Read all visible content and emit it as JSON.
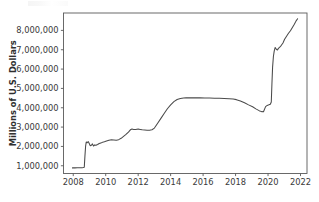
{
  "chart_data": {
    "type": "line",
    "title": "",
    "subtitle": "",
    "xlabel": "",
    "ylabel": "Millions of U.S. Dollars",
    "xlim": [
      2007.4,
      2022.4
    ],
    "ylim": [
      600000,
      8900000
    ],
    "xticks": [
      2008,
      2010,
      2012,
      2014,
      2016,
      2018,
      2020,
      2022
    ],
    "xticklabels": [
      "2008",
      "2010",
      "2012",
      "2014",
      "2016",
      "2018",
      "2020",
      "2022"
    ],
    "yticks": [
      1000000,
      2000000,
      3000000,
      4000000,
      5000000,
      6000000,
      7000000,
      8000000
    ],
    "yticklabels": [
      "1,000,000",
      "2,000,000",
      "3,000,000",
      "4,000,000",
      "5,000,000",
      "6,000,000",
      "7,000,000",
      "8,000,000"
    ],
    "grid": false,
    "legend": false,
    "legend_position": "none",
    "line_color": "#4a4a4a",
    "background_color": "#ffffff",
    "axis_color": "#5a5a5a",
    "series": [
      {
        "name": "Total Assets",
        "color": "#4a4a4a",
        "x": [
          2007.95,
          2008.1,
          2008.25,
          2008.4,
          2008.55,
          2008.62,
          2008.68,
          2008.72,
          2008.76,
          2008.8,
          2008.86,
          2008.92,
          2008.97,
          2009.05,
          2009.12,
          2009.18,
          2009.25,
          2009.32,
          2009.4,
          2009.5,
          2009.6,
          2009.7,
          2009.8,
          2009.92,
          2010.05,
          2010.2,
          2010.35,
          2010.5,
          2010.65,
          2010.8,
          2010.95,
          2011.1,
          2011.25,
          2011.4,
          2011.52,
          2011.62,
          2011.72,
          2011.85,
          2012.0,
          2012.12,
          2012.25,
          2012.4,
          2012.55,
          2012.7,
          2012.85,
          2013.0,
          2013.2,
          2013.4,
          2013.6,
          2013.8,
          2014.0,
          2014.2,
          2014.4,
          2014.6,
          2014.8,
          2014.95,
          2015.2,
          2015.5,
          2015.8,
          2016.1,
          2016.4,
          2016.7,
          2017.0,
          2017.3,
          2017.6,
          2017.85,
          2018.05,
          2018.3,
          2018.55,
          2018.8,
          2019.05,
          2019.25,
          2019.45,
          2019.6,
          2019.72,
          2019.85,
          2019.95,
          2020.05,
          2020.14,
          2020.2,
          2020.24,
          2020.28,
          2020.33,
          2020.38,
          2020.44,
          2020.52,
          2020.58,
          2020.64,
          2020.72,
          2020.82,
          2020.92,
          2021.02,
          2021.14,
          2021.26,
          2021.38,
          2021.5,
          2021.62,
          2021.72,
          2021.82
        ],
        "y": [
          890000,
          890000,
          892000,
          895000,
          900000,
          905000,
          920000,
          1500000,
          2000000,
          2230000,
          2190000,
          2250000,
          2180000,
          2035000,
          2060000,
          2130000,
          2020000,
          2080000,
          2060000,
          2100000,
          2150000,
          2180000,
          2210000,
          2240000,
          2280000,
          2320000,
          2340000,
          2330000,
          2320000,
          2350000,
          2420000,
          2520000,
          2620000,
          2740000,
          2860000,
          2900000,
          2880000,
          2870000,
          2900000,
          2880000,
          2860000,
          2850000,
          2840000,
          2840000,
          2860000,
          2950000,
          3200000,
          3450000,
          3700000,
          3950000,
          4150000,
          4320000,
          4430000,
          4480000,
          4500000,
          4510000,
          4510000,
          4510000,
          4510000,
          4500000,
          4500000,
          4495000,
          4490000,
          4480000,
          4470000,
          4450000,
          4420000,
          4350000,
          4260000,
          4150000,
          4050000,
          3940000,
          3850000,
          3800000,
          3790000,
          4060000,
          4120000,
          4150000,
          4180000,
          4300000,
          5250000,
          6100000,
          6650000,
          6930000,
          7120000,
          7010000,
          6990000,
          7070000,
          7130000,
          7230000,
          7350000,
          7540000,
          7700000,
          7850000,
          7980000,
          8150000,
          8320000,
          8480000,
          8600000
        ]
      }
    ]
  }
}
